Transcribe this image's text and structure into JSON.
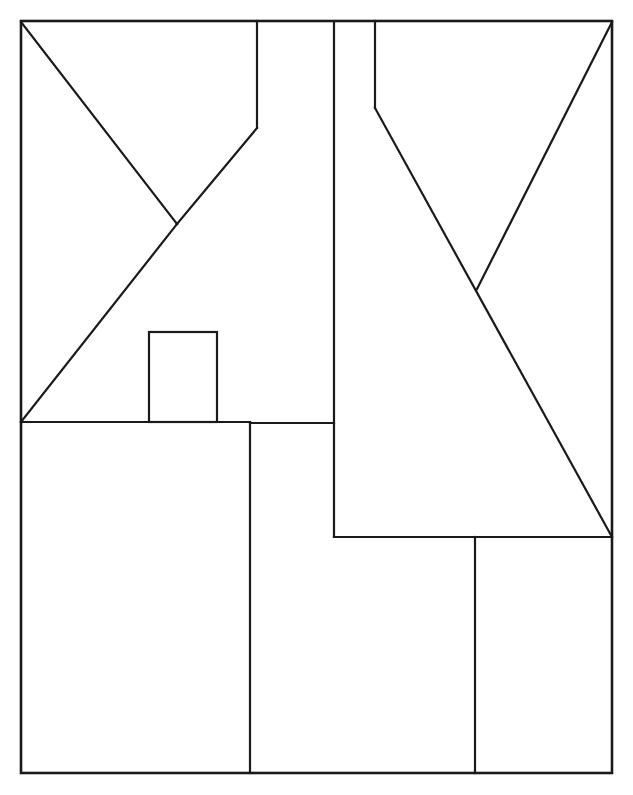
{
  "document": {
    "title": "Geometric Line Drawing",
    "description": "Abstract black-and-white line drawing of a rectangular frame subdivided by straight segments and diagonals, resembling a stylized house facade with a chimney.",
    "width": 633,
    "height": 795
  },
  "canvas": {
    "background_color": "#ffffff",
    "stroke_color": "#1a1a1a",
    "stroke_width": 2.2,
    "frame_stroke_width": 2.6
  },
  "figure": {
    "frame": {
      "name": "outer-rectangle",
      "x1": 21,
      "y1": 21,
      "x2": 612,
      "y2": 773
    },
    "shapes": [
      {
        "name": "chimney-rectangle",
        "type": "rect",
        "x": 149,
        "y": 332,
        "width": 68,
        "height": 90
      }
    ],
    "segments": [
      {
        "name": "upper-horizontal-left",
        "type": "line",
        "x1": 21,
        "y1": 422,
        "x2": 250,
        "y2": 422
      },
      {
        "name": "upper-horizontal-right",
        "type": "line",
        "x1": 250,
        "y1": 423,
        "x2": 334,
        "y2": 423
      },
      {
        "name": "diagonal-top-left-descending",
        "type": "line",
        "x1": 21,
        "y1": 22,
        "x2": 177,
        "y2": 224
      },
      {
        "name": "diagonal-left-v-right-ascending",
        "type": "line",
        "x1": 177,
        "y1": 224,
        "x2": 257,
        "y2": 128
      },
      {
        "name": "diagonal-left-long-ascending",
        "type": "line",
        "x1": 21,
        "y1": 422,
        "x2": 177,
        "y2": 224
      },
      {
        "name": "vertical-left-roof-post",
        "type": "line",
        "x1": 257,
        "y1": 21,
        "x2": 257,
        "y2": 128
      },
      {
        "name": "vertical-center-tall",
        "type": "line",
        "x1": 334,
        "y1": 21,
        "x2": 334,
        "y2": 537
      },
      {
        "name": "vertical-right-roof-post",
        "type": "line",
        "x1": 375,
        "y1": 21,
        "x2": 375,
        "y2": 108
      },
      {
        "name": "diagonal-right-long-descending",
        "type": "line",
        "x1": 375,
        "y1": 108,
        "x2": 612,
        "y2": 537
      },
      {
        "name": "diagonal-top-right-descending",
        "type": "line",
        "x1": 612,
        "y1": 22,
        "x2": 477,
        "y2": 289
      },
      {
        "name": "vertical-lower-left-divider",
        "type": "line",
        "x1": 250,
        "y1": 422,
        "x2": 250,
        "y2": 773
      },
      {
        "name": "horizontal-lower-right",
        "type": "line",
        "x1": 334,
        "y1": 537,
        "x2": 612,
        "y2": 537
      },
      {
        "name": "vertical-lower-right-divider",
        "type": "line",
        "x1": 475,
        "y1": 537,
        "x2": 475,
        "y2": 773
      }
    ]
  }
}
